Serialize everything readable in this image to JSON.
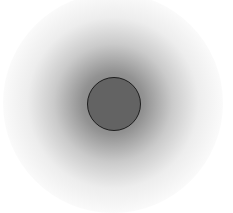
{
  "scene": {
    "description": "Blurred radial gray shadow with a solid gray disc at its center",
    "background_color": "#ffffff",
    "glow": {
      "center": [
        113,
        103
      ],
      "radius": 110,
      "inner_color": "#5a5a5a",
      "outer_color": "#ffffff"
    },
    "disc": {
      "center": [
        113,
        103
      ],
      "radius": 26,
      "fill_color": "#636363",
      "stroke_color": "#1e1e1e"
    }
  }
}
